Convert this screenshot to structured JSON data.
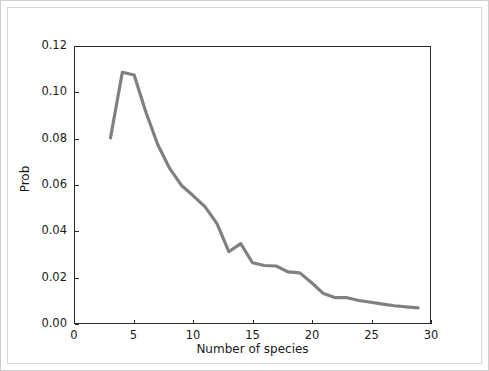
{
  "chart_data": {
    "type": "line",
    "title": "",
    "subtitle": "",
    "xlabel": "Number of species",
    "ylabel": "Prob",
    "xlim": [
      0,
      30
    ],
    "ylim": [
      0.0,
      0.12
    ],
    "grid": false,
    "legend": null,
    "legend_position": "none",
    "line_color": "#808080",
    "line_width": 3.2,
    "axis_color": "#2a2a2a",
    "background_color": "#ffffff",
    "xticks": [
      "0",
      "5",
      "10",
      "15",
      "20",
      "25",
      "30"
    ],
    "xtick_values": [
      0,
      5,
      10,
      15,
      20,
      25,
      30
    ],
    "yticks": [
      "0.00",
      "0.02",
      "0.04",
      "0.06",
      "0.08",
      "0.10",
      "0.12"
    ],
    "ytick_values": [
      0.0,
      0.02,
      0.04,
      0.06,
      0.08,
      0.1,
      0.12
    ],
    "x": [
      3,
      4,
      5,
      6,
      7,
      8,
      9,
      10,
      11,
      12,
      13,
      14,
      15,
      16,
      17,
      18,
      19,
      20,
      21,
      22,
      23,
      24,
      25,
      26,
      27,
      28,
      29
    ],
    "series": [
      {
        "name": "Prob",
        "values": [
          0.0805,
          0.109,
          0.1078,
          0.0915,
          0.0775,
          0.0672,
          0.0598,
          0.0553,
          0.0505,
          0.0432,
          0.031,
          0.0345,
          0.0262,
          0.025,
          0.0248,
          0.0222,
          0.0218,
          0.0175,
          0.0128,
          0.011,
          0.011,
          0.0098,
          0.009,
          0.0082,
          0.0075,
          0.007,
          0.0066
        ]
      }
    ]
  },
  "axes": {
    "xlabel": "Number of species",
    "ylabel": "Prob"
  }
}
